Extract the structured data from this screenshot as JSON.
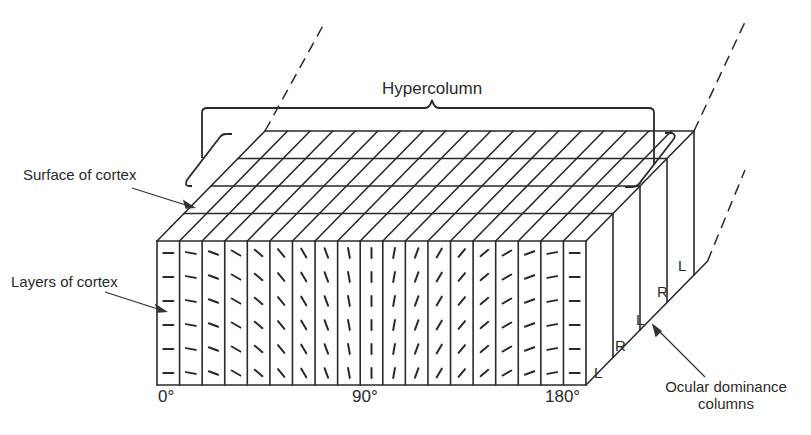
{
  "figure": {
    "title_label": "Hypercolumn",
    "labels": {
      "surface": "Surface of cortex",
      "layers": "Layers of cortex",
      "ocular_line1": "Ocular dominance",
      "ocular_line2": "columns"
    },
    "axis": {
      "start": "0°",
      "mid": "90°",
      "end": "180°"
    },
    "eye_labels": [
      "L",
      "R",
      "L",
      "R",
      "L"
    ],
    "orientation_columns": 19,
    "rows_per_column": 6,
    "orientation_angles_deg": [
      0,
      10,
      20,
      30,
      40,
      50,
      60,
      70,
      80,
      90,
      100,
      110,
      120,
      130,
      140,
      150,
      160,
      170,
      180
    ],
    "colors": {
      "line": "#2a2a2a",
      "background": "#ffffff"
    }
  }
}
